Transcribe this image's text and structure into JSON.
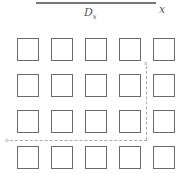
{
  "diagram": {
    "top_axis": {
      "label_center": "D",
      "label_center_sub": "x",
      "label_end": "x"
    },
    "grid": {
      "rows": 4,
      "cols": 5
    },
    "guide": {
      "vertical_label": "x",
      "horizontal_label": "o"
    }
  }
}
